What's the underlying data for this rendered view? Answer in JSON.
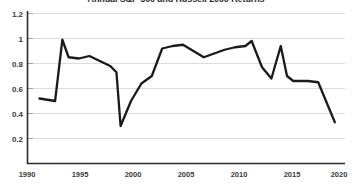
{
  "chart_data": {
    "type": "line",
    "title": "Annual S&P 500 and Russell 2000 Returns",
    "xlabel": "",
    "ylabel": "",
    "xlim": [
      1990,
      2020
    ],
    "ylim": [
      0,
      1.2
    ],
    "grid": true,
    "legend": "none",
    "series_color": "#1a1a1a",
    "gridline_color": "#d9d9d9",
    "axis_color": "#2b2b2b",
    "background_color": "#ffffff",
    "xticks": [
      1990,
      1995,
      2000,
      2005,
      2010,
      2015,
      2020
    ],
    "xtick_labels": [
      "1990",
      "1995",
      "2000",
      "2005",
      "2010",
      "2015",
      "2020"
    ],
    "yticks": [
      0.2,
      0.4,
      0.6,
      0.8,
      1.0,
      1.2
    ],
    "ytick_labels": [
      "0.2",
      "0.4",
      "0.6",
      "0.8",
      "1",
      "1.2"
    ],
    "x": [
      1991.2,
      1992.7,
      1993.4,
      1994.0,
      1995.0,
      1996.0,
      1997.0,
      1998.0,
      1998.6,
      1999.0,
      2000.0,
      2001.0,
      2002.0,
      2003.0,
      2004.0,
      2005.0,
      2006.0,
      2007.0,
      2008.0,
      2009.0,
      2010.0,
      2011.0,
      2011.6,
      2012.6,
      2013.5,
      2014.4,
      2015.0,
      2015.6,
      2017.0,
      2018.0,
      2019.6
    ],
    "values": [
      0.52,
      0.5,
      0.99,
      0.85,
      0.84,
      0.86,
      0.82,
      0.78,
      0.73,
      0.3,
      0.5,
      0.64,
      0.7,
      0.92,
      0.94,
      0.95,
      0.9,
      0.85,
      0.88,
      0.91,
      0.93,
      0.94,
      0.98,
      0.77,
      0.68,
      0.94,
      0.7,
      0.66,
      0.66,
      0.65,
      0.33
    ],
    "series": [
      {
        "name": "Annual S&P 500 and Russell 2000 Returns",
        "values": [
          0.52,
          0.5,
          0.99,
          0.85,
          0.84,
          0.86,
          0.82,
          0.78,
          0.73,
          0.3,
          0.5,
          0.64,
          0.7,
          0.92,
          0.94,
          0.95,
          0.9,
          0.85,
          0.88,
          0.91,
          0.93,
          0.94,
          0.98,
          0.77,
          0.68,
          0.94,
          0.7,
          0.66,
          0.66,
          0.65,
          0.33
        ]
      }
    ]
  }
}
